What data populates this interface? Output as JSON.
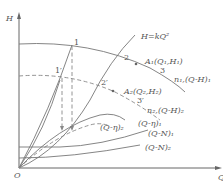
{
  "axes": {
    "y_label": "H",
    "x_label": "Q",
    "origin_label": "O"
  },
  "curves": {
    "system": "H=kQ²",
    "head_n1": "n₁,(Q-H)₁",
    "head_n2": "n₂,(Q-H)₂",
    "eff_1": "(Q-η)₁",
    "eff_2": "(Q-η)₂",
    "power_1": "(Q-N)₁",
    "power_2": "(Q-N)₂"
  },
  "points": {
    "A1": "A₁(Q₁,H₁)",
    "A2": "A₂(Q₂,H₂)",
    "p1": "1",
    "p1p": "1′",
    "p2": "2",
    "p2p": "2′",
    "p3": "3",
    "p3p": "3′"
  },
  "colors": {
    "line": "#777777",
    "text": "#555555"
  }
}
